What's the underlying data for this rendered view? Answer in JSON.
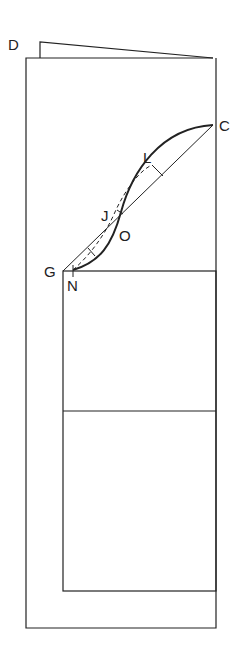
{
  "diagram": {
    "labels": {
      "D": "D",
      "C": "C",
      "L": "L",
      "J": "J",
      "O": "O",
      "G": "G",
      "N": "N"
    },
    "colors": {
      "line": "#222222",
      "background": "#ffffff"
    }
  }
}
